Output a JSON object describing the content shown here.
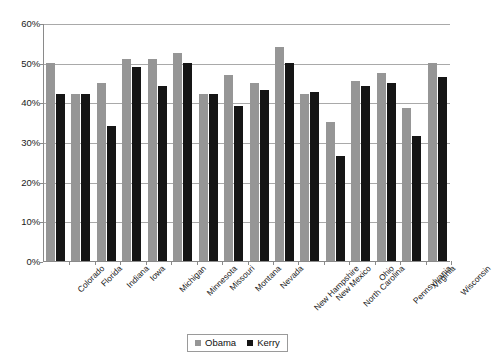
{
  "chart_data": {
    "type": "bar",
    "title": "",
    "xlabel": "",
    "ylabel": "",
    "ylim": [
      0,
      60
    ],
    "ytick_labels": [
      "0%",
      "10%",
      "20%",
      "30%",
      "40%",
      "50%",
      "60%"
    ],
    "ytick_values": [
      0,
      10,
      20,
      30,
      40,
      50,
      60
    ],
    "grid": true,
    "legend_position": "bottom-center",
    "categories": [
      "Colorado",
      "Florida",
      "Indiana",
      "Iowa",
      "Michigan",
      "Minnesota",
      "Missouri",
      "Montana",
      "Nevada",
      "New Hampshire",
      "New Mexico",
      "North Carolina",
      "Ohio",
      "Pennsylvania",
      "Virginia",
      "Wisconsin"
    ],
    "series": [
      {
        "name": "Obama",
        "color": "#969696",
        "values": [
          50.0,
          42.0,
          45.0,
          51.0,
          51.0,
          52.5,
          42.0,
          47.0,
          45.0,
          54.0,
          42.0,
          35.0,
          45.5,
          47.5,
          38.5,
          50.0
        ]
      },
      {
        "name": "Kerry",
        "color": "#151515",
        "values": [
          42.0,
          42.0,
          34.0,
          49.0,
          44.0,
          50.0,
          42.0,
          39.0,
          43.0,
          50.0,
          42.5,
          26.5,
          44.0,
          45.0,
          31.5,
          46.5
        ]
      }
    ]
  }
}
